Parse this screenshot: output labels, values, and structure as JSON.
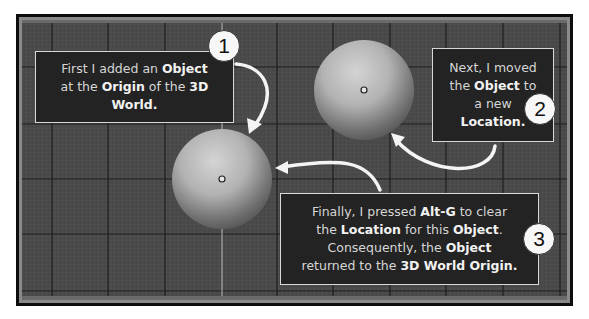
{
  "scene": {
    "description": "3D viewport grid with two spheres and callout annotations",
    "grid_color": "#1e1e1e",
    "axis_color": "#b8b8b8",
    "background_color": "#4a4a4a",
    "frame_inner_color": "#8a8a8a"
  },
  "callouts": [
    {
      "step": "1",
      "lines": [
        [
          {
            "t": "First I added an ",
            "b": false
          },
          {
            "t": "Object",
            "b": true
          }
        ],
        [
          {
            "t": "at the ",
            "b": false
          },
          {
            "t": "Origin",
            "b": true
          },
          {
            "t": " of the ",
            "b": false
          },
          {
            "t": "3D",
            "b": true
          }
        ],
        [
          {
            "t": "World.",
            "b": true
          }
        ]
      ]
    },
    {
      "step": "2",
      "lines": [
        [
          {
            "t": "Next, I moved",
            "b": false
          }
        ],
        [
          {
            "t": "the ",
            "b": false
          },
          {
            "t": "Object",
            "b": true
          },
          {
            "t": " to",
            "b": false
          }
        ],
        [
          {
            "t": "a new",
            "b": false
          }
        ],
        [
          {
            "t": "Location.",
            "b": true
          }
        ]
      ]
    },
    {
      "step": "3",
      "lines": [
        [
          {
            "t": "Finally, I pressed ",
            "b": false
          },
          {
            "t": "Alt-G",
            "b": true
          },
          {
            "t": " to clear",
            "b": false
          }
        ],
        [
          {
            "t": "the ",
            "b": false
          },
          {
            "t": "Location",
            "b": true
          },
          {
            "t": " for this ",
            "b": false
          },
          {
            "t": "Object",
            "b": true
          },
          {
            "t": ".",
            "b": false
          }
        ],
        [
          {
            "t": "Consequently, the ",
            "b": false
          },
          {
            "t": "Object",
            "b": true
          }
        ],
        [
          {
            "t": "returned to the ",
            "b": false
          },
          {
            "t": "3D World Origin",
            "b": true
          },
          {
            "t": ".",
            "b": true
          }
        ]
      ]
    }
  ],
  "badges": {
    "one": "1",
    "two": "2",
    "three": "3"
  },
  "spheres": [
    {
      "name": "sphere-at-origin",
      "label": "Object at 3D World Origin"
    },
    {
      "name": "sphere-moved",
      "label": "Object at new Location"
    }
  ]
}
